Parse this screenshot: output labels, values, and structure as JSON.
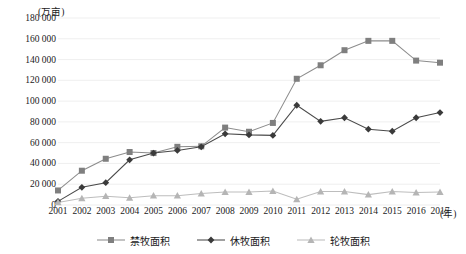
{
  "chart_data": {
    "type": "line",
    "title": "",
    "subtitle": "",
    "xlabel": "(年)",
    "ylabel": "(万亩)",
    "ylim": [
      0,
      180000
    ],
    "ytick_step": 20000,
    "grid": true,
    "legend_position": "bottom",
    "categories": [
      "2001",
      "2002",
      "2003",
      "2004",
      "2005",
      "2006",
      "2007",
      "2008",
      "2009",
      "2010",
      "2011",
      "2012",
      "2013",
      "2014",
      "2015",
      "2016",
      "2017"
    ],
    "ytick_labels": [
      "180 000",
      "160 000",
      "140 000",
      "120 000",
      "100 000",
      "80 000",
      "60 000",
      "40 000",
      "20 000",
      "0"
    ],
    "ytick_values": [
      180000,
      160000,
      140000,
      120000,
      100000,
      80000,
      60000,
      40000,
      20000,
      0
    ],
    "series": [
      {
        "name": "禁牧面积",
        "marker": "square",
        "color": "#7f7f7f",
        "line_color": "#8c8c8c",
        "values": [
          14000,
          33000,
          44500,
          51000,
          50000,
          56000,
          56500,
          74500,
          70500,
          79000,
          121500,
          134500,
          149000,
          158000,
          158000,
          139000,
          137000
        ]
      },
      {
        "name": "休牧面积",
        "marker": "diamond",
        "color": "#3a3a3a",
        "line_color": "#4a4a4a",
        "values": [
          3500,
          17000,
          21500,
          43500,
          50000,
          52500,
          56000,
          68500,
          67500,
          67000,
          96000,
          80500,
          84000,
          73000,
          71000,
          84000,
          89000
        ]
      },
      {
        "name": "轮牧面积",
        "marker": "triangle",
        "color": "#b5b5b5",
        "line_color": "#bdbdbd",
        "values": [
          2500,
          6500,
          8500,
          7000,
          9000,
          9000,
          11000,
          12500,
          12500,
          13500,
          5500,
          13000,
          13000,
          10000,
          13000,
          12000,
          12500
        ]
      }
    ]
  },
  "colors": {
    "background": "#ffffff",
    "grid": "#ededed",
    "text": "#1a1a1a"
  }
}
